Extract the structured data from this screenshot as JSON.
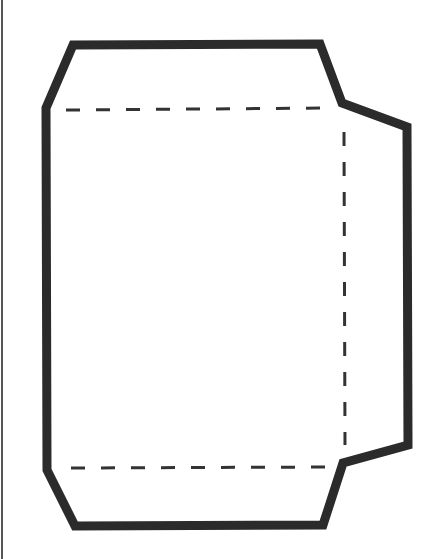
{
  "diagram": {
    "title": "Envelope template",
    "type": "envelope-die-cut-template",
    "colors": {
      "background": "#ffffff",
      "cut_line": "#2b2b2b",
      "fold_line": "#333333",
      "edge_line": "#555555"
    },
    "cut_outline": {
      "label": "cut line",
      "stroke_width": 9,
      "points": [
        [
          73,
          45
        ],
        [
          320,
          44
        ],
        [
          342,
          103
        ],
        [
          407,
          127
        ],
        [
          408,
          445
        ],
        [
          343,
          463
        ],
        [
          323,
          525
        ],
        [
          75,
          526
        ],
        [
          47,
          470
        ],
        [
          46,
          108
        ]
      ]
    },
    "fold_lines": [
      {
        "label": "top flap fold",
        "x1": 66,
        "y1": 110,
        "x2": 333,
        "y2": 108
      },
      {
        "label": "side flap fold",
        "x1": 344,
        "y1": 132,
        "x2": 345,
        "y2": 445
      },
      {
        "label": "bottom flap fold",
        "x1": 71,
        "y1": 468,
        "x2": 333,
        "y2": 467
      }
    ],
    "fold_line_style": {
      "stroke_width": 3,
      "dash": "14 16"
    },
    "page_edge": {
      "x": 2,
      "y1": 0,
      "y2": 559,
      "stroke_width": 2
    }
  }
}
